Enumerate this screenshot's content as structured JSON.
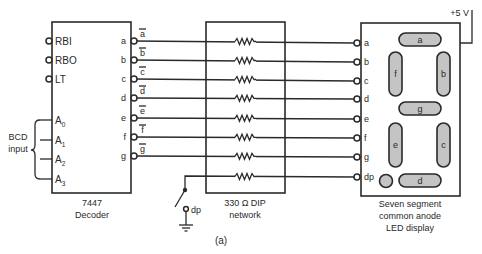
{
  "figure_label": "(a)",
  "decoder": {
    "name": "7447",
    "subtitle": "Decoder",
    "control_pins": [
      "RBI",
      "RBO",
      "LT"
    ],
    "inputs": [
      {
        "base": "A",
        "sub": "0"
      },
      {
        "base": "A",
        "sub": "1"
      },
      {
        "base": "A",
        "sub": "2"
      },
      {
        "base": "A",
        "sub": "3"
      }
    ],
    "input_group_label": [
      "BCD",
      "input"
    ],
    "outputs": [
      "a",
      "b",
      "c",
      "d",
      "e",
      "f",
      "g"
    ],
    "output_signals_inverted": [
      "a",
      "b",
      "c",
      "d",
      "e",
      "f",
      "g"
    ]
  },
  "resistor_network": {
    "title": "330 Ω DIP",
    "subtitle": "network",
    "resistor_count": 8
  },
  "switch": {
    "label": "dp"
  },
  "display": {
    "supply_label": "+5 V",
    "pins": [
      "a",
      "b",
      "c",
      "d",
      "e",
      "f",
      "g",
      "dp"
    ],
    "segments": [
      "a",
      "f",
      "b",
      "g",
      "e",
      "c",
      "d"
    ],
    "caption": [
      "Seven segment",
      "common anode",
      "LED display"
    ],
    "segment_fill": "#c4c4c4"
  }
}
